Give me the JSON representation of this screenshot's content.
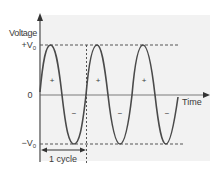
{
  "diagram": {
    "y_axis_label": "Voltage",
    "x_axis_label": "Time",
    "positive_peak_label": "+V",
    "positive_peak_sub": "0",
    "negative_peak_label": "−V",
    "negative_peak_sub": "0",
    "zero_label": "0",
    "cycle_label": "1 cycle",
    "half_cycle_signs": [
      "+",
      "−",
      "+",
      "−",
      "+",
      "−"
    ],
    "colors": {
      "background": "#f2f2f2",
      "axis": "#7a7a7a",
      "wave": "#4a4a4a",
      "dashed": "#555555",
      "text": "#3a3a3a"
    }
  }
}
